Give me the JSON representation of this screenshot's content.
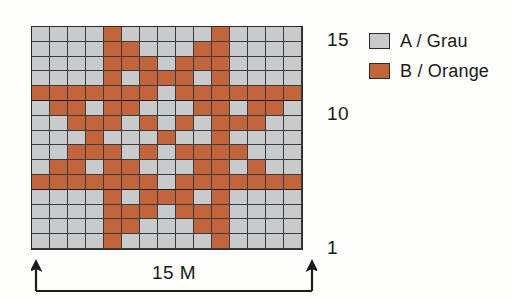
{
  "chart_data": {
    "type": "heatmap",
    "title": "",
    "columns": 15,
    "rows": 15,
    "xlabel": "15 M",
    "ylabel": "",
    "x_tick_labels": [],
    "y_tick_labels": [
      "1",
      "10",
      "15"
    ],
    "grid": true,
    "legend_position": "right",
    "colors": {
      "A": "#c8cacb",
      "B": "#c2653c",
      "grid_line": "#3a3a3a",
      "border": "#2b2b2b",
      "background": "#fdfdfb"
    },
    "legend": [
      {
        "key": "A",
        "label": "A / Grau",
        "color": "#c8cacb"
      },
      {
        "key": "B",
        "label": "B / Orange",
        "color": "#c2653c"
      }
    ],
    "row_order": "top_row_is_row_15_bottom_row_is_row_1",
    "cells_top_to_bottom": [
      [
        "A",
        "A",
        "A",
        "A",
        "B",
        "A",
        "A",
        "A",
        "A",
        "A",
        "B",
        "A",
        "A",
        "A",
        "A"
      ],
      [
        "A",
        "A",
        "A",
        "A",
        "B",
        "B",
        "A",
        "A",
        "A",
        "B",
        "B",
        "A",
        "A",
        "A",
        "A"
      ],
      [
        "A",
        "A",
        "A",
        "A",
        "B",
        "B",
        "B",
        "A",
        "B",
        "B",
        "B",
        "A",
        "A",
        "A",
        "A"
      ],
      [
        "A",
        "A",
        "A",
        "A",
        "B",
        "A",
        "B",
        "B",
        "B",
        "A",
        "B",
        "A",
        "A",
        "A",
        "A"
      ],
      [
        "B",
        "B",
        "B",
        "B",
        "B",
        "B",
        "B",
        "A",
        "B",
        "B",
        "B",
        "B",
        "B",
        "B",
        "B"
      ],
      [
        "A",
        "B",
        "B",
        "A",
        "B",
        "B",
        "A",
        "A",
        "A",
        "B",
        "B",
        "A",
        "B",
        "B",
        "A"
      ],
      [
        "A",
        "A",
        "B",
        "B",
        "B",
        "A",
        "B",
        "A",
        "B",
        "A",
        "B",
        "B",
        "B",
        "A",
        "A"
      ],
      [
        "A",
        "A",
        "A",
        "B",
        "A",
        "A",
        "A",
        "B",
        "A",
        "A",
        "B",
        "A",
        "A",
        "A",
        "A"
      ],
      [
        "A",
        "A",
        "B",
        "B",
        "B",
        "A",
        "B",
        "A",
        "B",
        "B",
        "B",
        "B",
        "A",
        "A",
        "A"
      ],
      [
        "A",
        "B",
        "B",
        "A",
        "B",
        "B",
        "A",
        "A",
        "A",
        "B",
        "B",
        "A",
        "B",
        "A",
        "A"
      ],
      [
        "B",
        "B",
        "B",
        "B",
        "B",
        "B",
        "B",
        "A",
        "B",
        "B",
        "B",
        "B",
        "B",
        "B",
        "B"
      ],
      [
        "A",
        "A",
        "A",
        "A",
        "B",
        "A",
        "B",
        "B",
        "B",
        "A",
        "B",
        "A",
        "A",
        "A",
        "A"
      ],
      [
        "A",
        "A",
        "A",
        "A",
        "B",
        "B",
        "B",
        "A",
        "B",
        "B",
        "B",
        "A",
        "A",
        "A",
        "A"
      ],
      [
        "A",
        "A",
        "A",
        "A",
        "B",
        "B",
        "A",
        "A",
        "A",
        "B",
        "B",
        "A",
        "A",
        "A",
        "A"
      ],
      [
        "A",
        "A",
        "A",
        "A",
        "B",
        "A",
        "A",
        "A",
        "A",
        "A",
        "B",
        "A",
        "A",
        "A",
        "A"
      ]
    ],
    "heavy_rule_after_rows_from_top": [
      5,
      11
    ]
  },
  "row_labels": {
    "top": "15",
    "middle": "10",
    "bottom": "1"
  },
  "legend": {
    "items": [
      {
        "label": "A / Grau"
      },
      {
        "label": "B / Orange"
      }
    ]
  },
  "width_axis": {
    "caption": "15 M"
  }
}
